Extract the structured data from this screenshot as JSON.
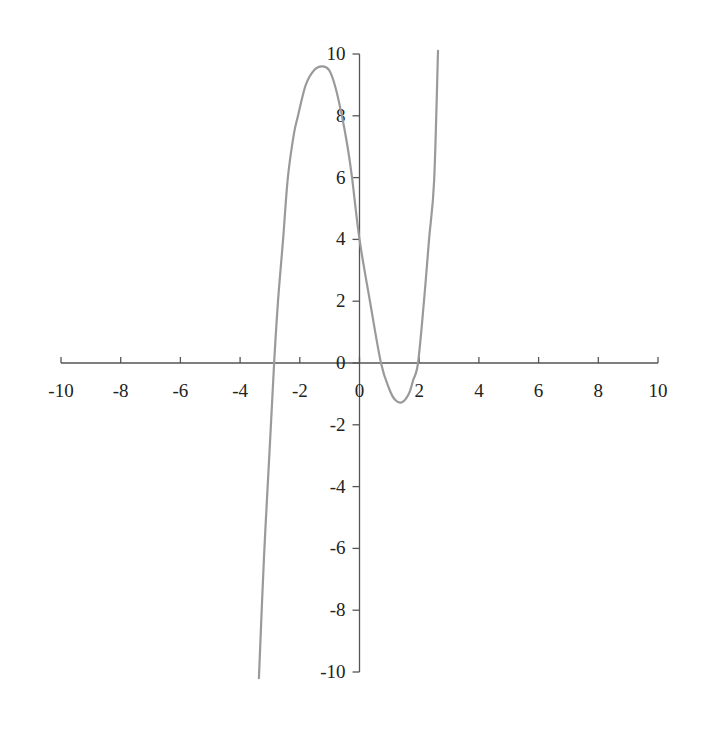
{
  "chart_data": {
    "type": "line",
    "title": "",
    "xlabel": "",
    "ylabel": "",
    "xlim": [
      -10,
      10
    ],
    "ylim": [
      -10,
      10
    ],
    "grid": false,
    "legend": null,
    "x_ticks": [
      -10,
      -8,
      -6,
      -4,
      -2,
      0,
      2,
      4,
      6,
      8,
      10
    ],
    "y_ticks": [
      -10,
      -8,
      -6,
      -4,
      -2,
      0,
      2,
      4,
      6,
      8,
      10
    ],
    "x_tick_labels": [
      "-10",
      "-8",
      "-6",
      "-4",
      "-2",
      "0",
      "2",
      "4",
      "6",
      "8",
      "10"
    ],
    "y_tick_labels": [
      "-10",
      "-8",
      "-6",
      "-4",
      "-2",
      "0",
      "2",
      "4",
      "6",
      "8",
      "10"
    ],
    "series": [
      {
        "name": "curve",
        "color": "#9a9a9a",
        "x": [
          -3.37,
          -3.2,
          -3.0,
          -2.86,
          -2.73,
          -2.56,
          -2.4,
          -2.2,
          -2.06,
          -1.8,
          -1.5,
          -1.22,
          -1.0,
          -0.8,
          -0.59,
          -0.4,
          -0.25,
          0.0,
          0.35,
          0.72,
          1.0,
          1.2,
          1.42,
          1.65,
          1.8,
          1.96,
          2.16,
          2.33,
          2.5,
          2.63
        ],
        "y": [
          -10.2,
          -6.3,
          -2.6,
          0.0,
          2.0,
          4.0,
          6.0,
          7.4,
          8.0,
          9.0,
          9.5,
          9.6,
          9.45,
          8.9,
          8.0,
          7.0,
          6.0,
          4.0,
          2.0,
          0.0,
          -0.85,
          -1.2,
          -1.27,
          -1.0,
          -0.55,
          0.0,
          2.0,
          4.0,
          5.9,
          10.1
        ]
      }
    ],
    "annotations": {
      "roots": [
        -2.86,
        0.72,
        1.96
      ],
      "local_max": [
        -1.22,
        9.6
      ],
      "local_min": [
        1.42,
        -1.27
      ],
      "y_intercept": 4
    }
  },
  "colors": {
    "axis": "#555555",
    "curve": "#9a9a9a",
    "text": "#222222",
    "background": "#ffffff"
  }
}
